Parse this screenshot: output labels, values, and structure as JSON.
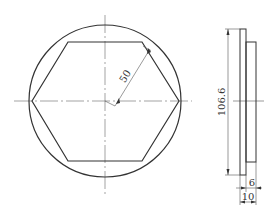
{
  "drawing": {
    "type": "technical-drawing",
    "front_view": {
      "circle": {
        "cx": 105,
        "cy": 101,
        "r": 76
      },
      "hexagon_points": "32,101 68,42 142,42 179,101 142,161 68,161",
      "radius_dimension": {
        "label": "50",
        "from": [
          105,
          101
        ],
        "to": [
          148,
          49
        ]
      }
    },
    "side_view": {
      "height_dimension": {
        "label": "106.6"
      },
      "thickness_step_dimension": {
        "label": "6"
      },
      "total_thickness_dimension": {
        "label": "10"
      }
    },
    "colors": {
      "outline": "#333333",
      "thin_line": "#666666"
    }
  }
}
